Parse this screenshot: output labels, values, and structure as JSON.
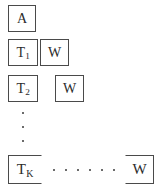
{
  "diagram": {
    "type": "staircase-block-structure",
    "background_color": "#ffffff",
    "stroke_color": "#4a4a4a",
    "text_color": "#2b2b2b",
    "rows": [
      {
        "id": "row-a",
        "boxes": [
          {
            "id": "box-a",
            "label": "A",
            "subscript": "",
            "x": 8,
            "y": 5,
            "w": 28,
            "h": 27,
            "open_side": "none"
          }
        ],
        "ellipsis": null
      },
      {
        "id": "row-t1",
        "boxes": [
          {
            "id": "box-t1",
            "label": "T",
            "subscript": "1",
            "x": 8,
            "y": 39,
            "w": 30,
            "h": 27,
            "open_side": "none"
          },
          {
            "id": "box-w1",
            "label": "W",
            "subscript": "",
            "x": 40,
            "y": 39,
            "w": 29,
            "h": 27,
            "open_side": "none"
          }
        ],
        "ellipsis": null
      },
      {
        "id": "row-t2",
        "boxes": [
          {
            "id": "box-t2",
            "label": "T",
            "subscript": "2",
            "x": 8,
            "y": 75,
            "w": 30,
            "h": 27,
            "open_side": "none"
          },
          {
            "id": "box-w2",
            "label": "W",
            "subscript": "",
            "x": 55,
            "y": 75,
            "w": 29,
            "h": 27,
            "open_side": "none"
          }
        ],
        "ellipsis": null
      },
      {
        "id": "row-tk",
        "boxes": [
          {
            "id": "box-tk",
            "label": "T",
            "subscript": "K",
            "x": 8,
            "y": 155,
            "w": 34,
            "h": 29,
            "open_side": "right"
          },
          {
            "id": "box-wk",
            "label": "W",
            "subscript": "",
            "x": 125,
            "y": 155,
            "w": 29,
            "h": 29,
            "open_side": "left"
          }
        ],
        "ellipsis": {
          "id": "hdots-tk",
          "orientation": "horizontal",
          "count": 6,
          "x": 53,
          "y": 168,
          "w": 62,
          "h": 3
        }
      }
    ],
    "vertical_ellipsis": {
      "id": "vdots-rows",
      "orientation": "vertical",
      "count": 3,
      "x": 21,
      "y": 112,
      "w": 3,
      "h": 30
    }
  }
}
